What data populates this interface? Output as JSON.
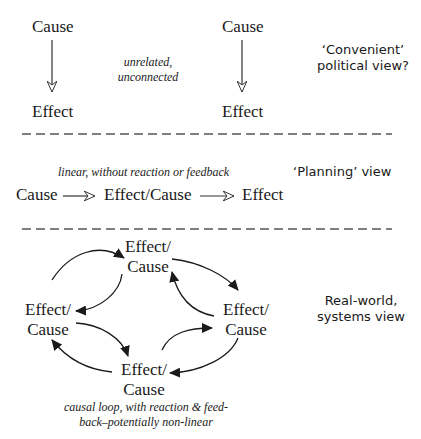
{
  "section1": {
    "left_cause": "Cause",
    "left_effect": "Effect",
    "right_cause": "Cause",
    "right_effect": "Effect",
    "note_line1": "unrelated,",
    "note_line2": "unconnected",
    "view_line1": "‘Convenient’",
    "view_line2": "political view?"
  },
  "section2": {
    "note": "linear, without reaction or feedback",
    "view": "‘Planning’ view",
    "chain": [
      "Cause",
      "Effect/Cause",
      "Effect"
    ]
  },
  "section3": {
    "nodes": {
      "top": [
        "Effect/",
        "Cause"
      ],
      "left": [
        "Effect/",
        "Cause"
      ],
      "right": [
        "Effect/",
        "Cause"
      ],
      "bottom": [
        "Effect/",
        "Cause"
      ]
    },
    "view_line1": "Real-world,",
    "view_line2": "systems view",
    "note_line1": "causal loop, with reaction & feed-",
    "note_line2": "back–potentially non-linear"
  },
  "colors": {
    "text": "#1a1a1a",
    "line": "#333333",
    "divider": "#555555"
  }
}
